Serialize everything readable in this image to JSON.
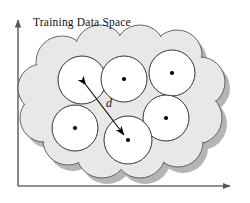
{
  "figure": {
    "title": "Training Data Space",
    "distance_label": "d",
    "background_color": "#ffffff",
    "axis_color": "#6b6b6b",
    "cloud_fill": "#e8e8e8",
    "cloud_stroke": "#555555",
    "shadow_color": "#a8a8a8",
    "circle_fill": "#ffffff",
    "circle_stroke": "#333333",
    "dot_color": "#000000",
    "arrow_color": "#000000"
  },
  "axes": {
    "y_axis_name": "vertical-axis",
    "x_axis_name": "horizontal-axis",
    "origin_x": 18,
    "origin_y": 186,
    "y_top": 14,
    "x_right": 238
  },
  "cloud": {
    "name": "training-data-space-cloud",
    "bumps": [
      {
        "cx": 62,
        "cy": 62,
        "r": 26
      },
      {
        "cx": 100,
        "cy": 50,
        "r": 25
      },
      {
        "cx": 140,
        "cy": 50,
        "r": 25
      },
      {
        "cx": 177,
        "cy": 55,
        "r": 25
      },
      {
        "cx": 200,
        "cy": 82,
        "r": 25
      },
      {
        "cx": 196,
        "cy": 118,
        "r": 26
      },
      {
        "cx": 178,
        "cy": 142,
        "r": 25
      },
      {
        "cx": 140,
        "cy": 152,
        "r": 26
      },
      {
        "cx": 102,
        "cy": 152,
        "r": 26
      },
      {
        "cx": 68,
        "cy": 140,
        "r": 25
      },
      {
        "cx": 44,
        "cy": 118,
        "r": 24
      },
      {
        "cx": 42,
        "cy": 88,
        "r": 24
      }
    ]
  },
  "clusters": [
    {
      "id": "cluster-top-left",
      "cx": 82,
      "cy": 80,
      "r": 24
    },
    {
      "id": "cluster-top-middle",
      "cx": 124,
      "cy": 79,
      "r": 23
    },
    {
      "id": "cluster-top-right",
      "cx": 172,
      "cy": 73,
      "r": 23
    },
    {
      "id": "cluster-bottom-left",
      "cx": 75,
      "cy": 128,
      "r": 23
    },
    {
      "id": "cluster-bottom-middle",
      "cx": 128,
      "cy": 140,
      "r": 24
    },
    {
      "id": "cluster-middle-right",
      "cx": 166,
      "cy": 118,
      "r": 23
    }
  ],
  "distance_arrow": {
    "name": "distance-arrow",
    "from_x": 82,
    "from_y": 80,
    "to_x": 128,
    "to_y": 140,
    "double_headed": true
  }
}
